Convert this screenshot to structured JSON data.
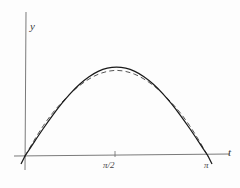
{
  "figure": {
    "kind": "math-plot",
    "background_color": "#fdfdfd",
    "axis_color": "#6b6b6b",
    "solid_curve_color": "#1a1a1a",
    "dashed_curve_color": "#555555"
  },
  "axes": {
    "y_axis_label": "y",
    "x_axis_label": "t",
    "x_ticks": [
      {
        "label": "π/2",
        "value": 1.5708
      },
      {
        "label": "π",
        "value": 3.1416
      }
    ]
  },
  "chart_data": {
    "type": "line",
    "title": "",
    "xlabel": "t",
    "ylabel": "y",
    "xlim": [
      -0.15,
      3.45
    ],
    "ylim": [
      -0.12,
      1.25
    ],
    "grid": false,
    "legend": "none",
    "x_tick_labels": [
      "π/2",
      "π"
    ],
    "x_tick_values": [
      1.5708,
      3.1416
    ],
    "y_tick_labels": [],
    "y_tick_values": [],
    "series": [
      {
        "name": "exact solution",
        "style": "solid",
        "color": "#1a1a1a",
        "x": [
          0,
          0.1571,
          0.3142,
          0.4712,
          0.6283,
          0.7854,
          0.9425,
          1.0996,
          1.2566,
          1.4137,
          1.5708,
          1.7279,
          1.885,
          2.042,
          2.1991,
          2.3562,
          2.5133,
          2.6704,
          2.8274,
          2.9845,
          3.1416
        ],
        "y": [
          0,
          0.1564,
          0.309,
          0.454,
          0.5878,
          0.7071,
          0.809,
          0.891,
          0.9511,
          0.9877,
          1.0,
          0.9877,
          0.9511,
          0.891,
          0.809,
          0.7071,
          0.5878,
          0.454,
          0.309,
          0.1564,
          0
        ]
      },
      {
        "name": "approximation",
        "style": "dashed",
        "color": "#555555",
        "x": [
          0,
          0.1571,
          0.3142,
          0.4712,
          0.6283,
          0.7854,
          0.9425,
          1.0996,
          1.2566,
          1.4137,
          1.5708,
          1.7279,
          1.885,
          2.042,
          2.1991,
          2.3562,
          2.5133,
          2.6704,
          2.8274,
          2.9845,
          3.1416
        ],
        "y": [
          0,
          0.1768,
          0.34,
          0.481,
          0.6,
          0.706,
          0.794,
          0.865,
          0.918,
          0.95,
          0.962,
          0.95,
          0.918,
          0.865,
          0.794,
          0.706,
          0.6,
          0.481,
          0.34,
          0.1768,
          0
        ]
      }
    ]
  }
}
